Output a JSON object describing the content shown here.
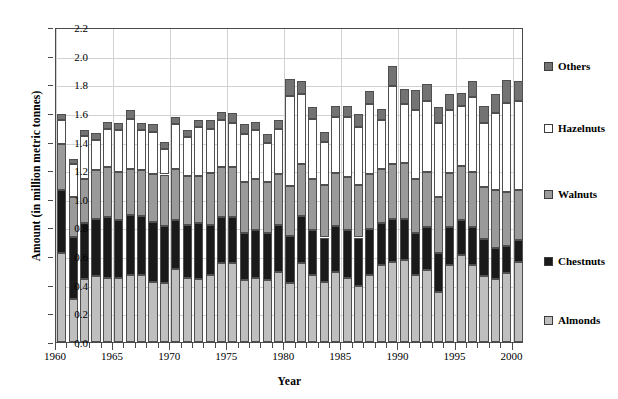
{
  "figure": {
    "title_remnant": "",
    "width": 618,
    "height": 399
  },
  "axes": {
    "ylabel": "Amount (in million metric tonnes)",
    "xlabel": "Year",
    "yticks": [
      "0.0",
      "0.2",
      "0.4",
      "0.6",
      "0.8",
      "1.0",
      "1.2",
      "1.4",
      "1.6",
      "1.8",
      "2.0",
      "2.2"
    ],
    "xticks": [
      "1960",
      "1965",
      "1970",
      "1975",
      "1980",
      "1985",
      "1990",
      "1995",
      "2000"
    ]
  },
  "legend": {
    "position": "right",
    "items": [
      {
        "label": "Others",
        "color": "#737373"
      },
      {
        "label": "Hazelnuts",
        "color": "#ffffff"
      },
      {
        "label": "Walnuts",
        "color": "#9a9a9a"
      },
      {
        "label": "Chestnuts",
        "color": "#1a1a1a"
      },
      {
        "label": "Almonds",
        "color": "#bfbfbf"
      }
    ]
  },
  "chart_data": {
    "type": "bar",
    "subtype": "stacked",
    "title": "",
    "xlabel": "Year",
    "ylabel": "Amount (in million metric tonnes)",
    "ylim": [
      0.0,
      2.2
    ],
    "ytick_step": 0.2,
    "grid": true,
    "legend_position": "right",
    "categories": [
      "1960",
      "1961",
      "1962",
      "1963",
      "1964",
      "1965",
      "1966",
      "1967",
      "1968",
      "1969",
      "1970",
      "1971",
      "1972",
      "1973",
      "1974",
      "1975",
      "1976",
      "1977",
      "1978",
      "1979",
      "1980",
      "1981",
      "1982",
      "1983",
      "1984",
      "1985",
      "1986",
      "1987",
      "1988",
      "1989",
      "1990",
      "1991",
      "1992",
      "1993",
      "1994",
      "1995",
      "1996",
      "1997",
      "1998",
      "1999",
      "2000"
    ],
    "stack_order_bottom_to_top": [
      "Almonds",
      "Chestnuts",
      "Walnuts",
      "Hazelnuts",
      "Others"
    ],
    "series": [
      {
        "name": "Almonds",
        "color": "#bfbfbf",
        "values": [
          0.62,
          0.3,
          0.44,
          0.46,
          0.45,
          0.45,
          0.47,
          0.47,
          0.42,
          0.41,
          0.51,
          0.45,
          0.44,
          0.47,
          0.55,
          0.55,
          0.43,
          0.45,
          0.43,
          0.49,
          0.41,
          0.55,
          0.47,
          0.42,
          0.49,
          0.45,
          0.39,
          0.47,
          0.54,
          0.56,
          0.57,
          0.47,
          0.5,
          0.35,
          0.54,
          0.61,
          0.54,
          0.46,
          0.44,
          0.48,
          0.56
        ]
      },
      {
        "name": "Chestnuts",
        "color": "#1a1a1a",
        "values": [
          0.44,
          0.43,
          0.39,
          0.4,
          0.42,
          0.4,
          0.42,
          0.41,
          0.42,
          0.4,
          0.34,
          0.37,
          0.39,
          0.35,
          0.32,
          0.32,
          0.33,
          0.33,
          0.33,
          0.33,
          0.33,
          0.33,
          0.31,
          0.31,
          0.32,
          0.33,
          0.34,
          0.32,
          0.29,
          0.3,
          0.29,
          0.29,
          0.3,
          0.27,
          0.26,
          0.24,
          0.26,
          0.26,
          0.22,
          0.19,
          0.15
        ]
      },
      {
        "name": "Walnuts",
        "color": "#9a9a9a",
        "values": [
          0.32,
          0.28,
          0.31,
          0.34,
          0.35,
          0.34,
          0.32,
          0.32,
          0.33,
          0.36,
          0.36,
          0.34,
          0.33,
          0.36,
          0.35,
          0.35,
          0.36,
          0.36,
          0.36,
          0.35,
          0.35,
          0.36,
          0.36,
          0.37,
          0.37,
          0.37,
          0.37,
          0.38,
          0.38,
          0.38,
          0.39,
          0.38,
          0.39,
          0.39,
          0.38,
          0.38,
          0.39,
          0.36,
          0.4,
          0.38,
          0.35
        ]
      },
      {
        "name": "Hazelnuts",
        "color": "#ffffff",
        "values": [
          0.17,
          0.23,
          0.3,
          0.21,
          0.27,
          0.29,
          0.35,
          0.28,
          0.3,
          0.18,
          0.31,
          0.27,
          0.34,
          0.31,
          0.33,
          0.31,
          0.33,
          0.34,
          0.27,
          0.32,
          0.63,
          0.49,
          0.42,
          0.3,
          0.39,
          0.42,
          0.4,
          0.49,
          0.34,
          0.55,
          0.41,
          0.48,
          0.49,
          0.52,
          0.44,
          0.42,
          0.52,
          0.45,
          0.54,
          0.62,
          0.62
        ]
      },
      {
        "name": "Others",
        "color": "#737373",
        "values": [
          0.04,
          0.04,
          0.04,
          0.05,
          0.05,
          0.05,
          0.06,
          0.05,
          0.05,
          0.05,
          0.05,
          0.05,
          0.05,
          0.06,
          0.06,
          0.07,
          0.07,
          0.06,
          0.06,
          0.06,
          0.12,
          0.09,
          0.08,
          0.07,
          0.08,
          0.08,
          0.09,
          0.09,
          0.08,
          0.14,
          0.11,
          0.14,
          0.12,
          0.11,
          0.11,
          0.09,
          0.11,
          0.12,
          0.13,
          0.16,
          0.14
        ]
      }
    ]
  }
}
